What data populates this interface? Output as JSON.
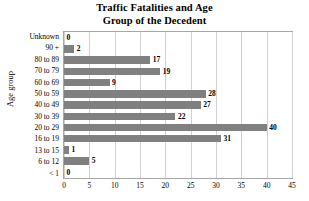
{
  "chart_data": {
    "type": "bar",
    "orientation": "horizontal",
    "title": "Traffic Fatalities and Age Group of the Decedent",
    "title_lines": [
      "Traffic Fatalities and Age",
      "Group of the Decedent"
    ],
    "xlabel": "",
    "ylabel": "Age group",
    "categories": [
      "Unknown",
      "90 +",
      "80 to 89",
      "70 to 79",
      "60 to 69",
      "50 to 59",
      "40 to 49",
      "30 to 39",
      "20 to 29",
      "16 to 19",
      "13 to 15",
      "6 to 12",
      "< 1"
    ],
    "values": [
      0,
      2,
      17,
      19,
      9,
      28,
      27,
      22,
      40,
      31,
      1,
      5,
      0
    ],
    "data_labels": [
      "0",
      "2",
      "17",
      "19",
      "9",
      "28",
      "27",
      "22",
      "40",
      "31",
      "1",
      "5",
      "0"
    ],
    "xlim": [
      0,
      45
    ],
    "xticks": [
      0,
      5,
      10,
      15,
      20,
      25,
      30,
      35,
      40,
      45
    ],
    "xtick_labels": [
      "0",
      "5",
      "10",
      "15",
      "20",
      "25",
      "30",
      "35",
      "40",
      "45"
    ],
    "grid": "vertical",
    "legend": "none",
    "bar_color": "#808080",
    "gridline_color": "#d0d0d0",
    "plot_border_color": "#a6a6a6",
    "background_color": "#ffffff"
  }
}
